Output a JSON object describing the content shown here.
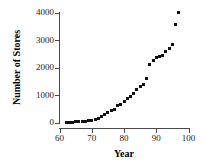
{
  "chart_data": {
    "type": "scatter",
    "title": "",
    "xlabel": "Year",
    "ylabel": "Number of Stores",
    "xlim": [
      60,
      100
    ],
    "ylim": [
      0,
      4000
    ],
    "xticks": [
      60,
      70,
      80,
      90,
      100
    ],
    "yticks": [
      0,
      1000,
      2000,
      3000,
      4000
    ],
    "grid": false,
    "legend": null,
    "marker": "filled-square",
    "marker_color": "#111111",
    "axis_color": "#4a4a4a",
    "x": [
      62,
      63,
      64,
      65,
      66,
      67,
      68,
      69,
      70,
      71,
      72,
      73,
      74,
      75,
      76,
      77,
      78,
      79,
      80,
      81,
      82,
      83,
      84,
      85,
      86,
      87,
      88,
      89,
      90,
      91,
      92,
      93,
      94,
      95,
      96,
      97
    ],
    "y": [
      9,
      15,
      20,
      25,
      30,
      40,
      55,
      70,
      90,
      120,
      160,
      210,
      280,
      370,
      450,
      470,
      620,
      660,
      780,
      860,
      950,
      1070,
      1200,
      1300,
      1400,
      1600,
      2100,
      2250,
      2350,
      2400,
      2450,
      2600,
      2700,
      2840,
      3550,
      3990
    ],
    "series": [
      {
        "name": "Number of Stores",
        "points": [
          [
            62,
            9
          ],
          [
            63,
            15
          ],
          [
            64,
            20
          ],
          [
            65,
            25
          ],
          [
            66,
            30
          ],
          [
            67,
            40
          ],
          [
            68,
            55
          ],
          [
            69,
            70
          ],
          [
            70,
            90
          ],
          [
            71,
            120
          ],
          [
            72,
            160
          ],
          [
            73,
            210
          ],
          [
            74,
            280
          ],
          [
            75,
            370
          ],
          [
            76,
            450
          ],
          [
            77,
            470
          ],
          [
            78,
            620
          ],
          [
            79,
            660
          ],
          [
            80,
            780
          ],
          [
            81,
            860
          ],
          [
            82,
            950
          ],
          [
            83,
            1070
          ],
          [
            84,
            1200
          ],
          [
            85,
            1300
          ],
          [
            86,
            1400
          ],
          [
            87,
            1600
          ],
          [
            88,
            2100
          ],
          [
            89,
            2250
          ],
          [
            90,
            2350
          ],
          [
            91,
            2400
          ],
          [
            92,
            2450
          ],
          [
            93,
            2600
          ],
          [
            94,
            2700
          ],
          [
            95,
            2840
          ],
          [
            96,
            3550
          ],
          [
            97,
            3990
          ]
        ]
      }
    ]
  },
  "axes": {
    "y_tick_labels": [
      "4000",
      "3000",
      "2000",
      "1000",
      "0"
    ],
    "x_tick_labels": [
      "60",
      "70",
      "80",
      "90",
      "100"
    ],
    "y_title": "Number of Stores",
    "x_title": "Year"
  }
}
